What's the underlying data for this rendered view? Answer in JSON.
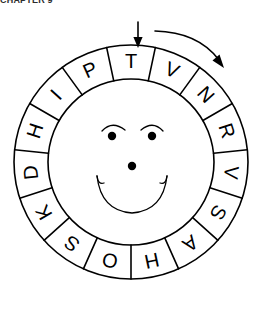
{
  "header": {
    "clipped_text": "CHAPTER 9"
  },
  "figure": {
    "wheel": {
      "name": "rotating-letter-wheel",
      "segment_count": 15,
      "order": "clockwise-from-top",
      "letters": [
        "T",
        "V",
        "N",
        "R",
        "V",
        "S",
        "A",
        "H",
        "O",
        "S",
        "K",
        "D",
        "H",
        "I",
        "P"
      ],
      "stroke_color": "#000000",
      "fill_color": "#ffffff"
    },
    "face": {
      "name": "smiley-face",
      "eyes": 2,
      "has_eyebrows": true,
      "has_nose": true,
      "has_smile": true
    },
    "pointer": {
      "name": "down-arrow-pointer",
      "points_to_letter": "T",
      "direction": "down"
    },
    "rotation_arrow": {
      "name": "clockwise-rotation-arrow",
      "direction": "clockwise"
    }
  }
}
